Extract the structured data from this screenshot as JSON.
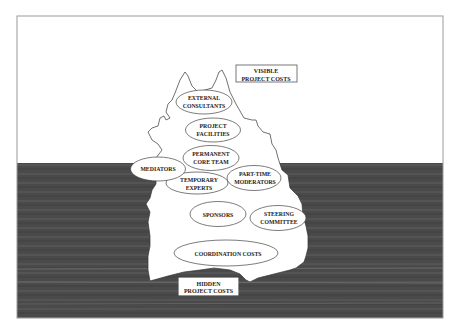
{
  "diagram": {
    "type": "iceberg",
    "colors": {
      "sky": "#ffffff",
      "water": "#4a4a4a",
      "ice": "#ffffff",
      "outline": "#333333",
      "frame": "#9a9a9a"
    },
    "labels": {
      "visible": {
        "line1": "VISIBLE",
        "line2": "PROJECT COSTS"
      },
      "hidden": {
        "line1": "HIDDEN",
        "line2": "PROJECT COSTS"
      }
    },
    "items": [
      {
        "id": "external-consultants",
        "line1": "EXTERNAL",
        "line2": "CONSULTANTS",
        "zone": "visible"
      },
      {
        "id": "project-facilities",
        "line1": "PROJECT",
        "line2": "FACILITIES",
        "zone": "visible"
      },
      {
        "id": "permanent-core-team",
        "line1": "PERMANENT",
        "line2": "CORE TEAM",
        "zone": "visible"
      },
      {
        "id": "mediators",
        "line1": "MEDIATORS",
        "line2": "",
        "zone": "hidden"
      },
      {
        "id": "temporary-experts",
        "line1": "TEMPORARY",
        "line2": "EXPERTS",
        "zone": "hidden"
      },
      {
        "id": "part-time-moderators",
        "line1": "PART-TIME",
        "line2": "MODERATORS",
        "zone": "hidden"
      },
      {
        "id": "sponsors",
        "line1": "SPONSORS",
        "line2": "",
        "zone": "hidden"
      },
      {
        "id": "steering-committee",
        "line1": "STEERING",
        "line2": "COMMITTEE",
        "zone": "hidden"
      },
      {
        "id": "coordination-costs",
        "line1": "COORDINATION COSTS",
        "line2": "",
        "zone": "hidden"
      }
    ]
  }
}
